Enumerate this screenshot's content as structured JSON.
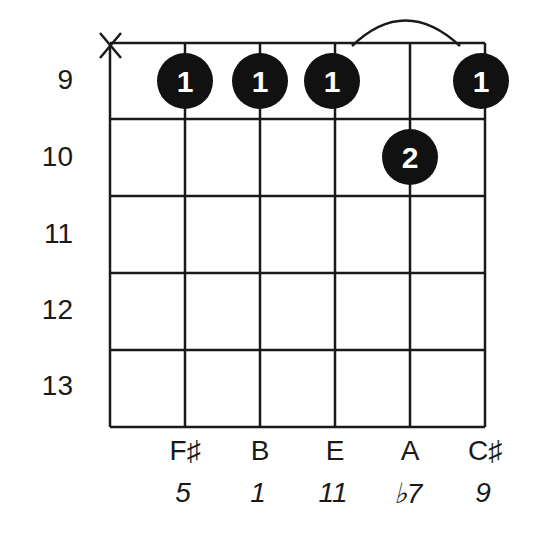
{
  "diagram": {
    "type": "guitar-chord-diagram",
    "muted_strings": [
      "6"
    ],
    "frets": [
      "9",
      "10",
      "11",
      "12",
      "13"
    ],
    "strings": [
      {
        "string": "6",
        "note": "",
        "interval": "",
        "muted": true
      },
      {
        "string": "5",
        "note": "F♯",
        "interval": "5",
        "fret": "9",
        "finger": "1"
      },
      {
        "string": "4",
        "note": "B",
        "interval": "1",
        "fret": "9",
        "finger": "1"
      },
      {
        "string": "3",
        "note": "E",
        "interval": "11",
        "fret": "9",
        "finger": "1"
      },
      {
        "string": "2",
        "note": "A",
        "interval": "♭7",
        "fret": "10",
        "finger": "2"
      },
      {
        "string": "1",
        "note": "C♯",
        "interval": "9",
        "fret": "9",
        "finger": "1"
      }
    ],
    "mute_symbol": "X",
    "barre": {
      "from_string": "3",
      "to_string": "1",
      "fret": "9"
    },
    "colors": {
      "dot": "#111111",
      "finger_text": "#ffffff",
      "line": "#1a1a1a"
    }
  }
}
